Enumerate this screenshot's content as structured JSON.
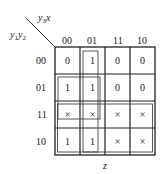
{
  "kmap": {
    "col_var_label": "y3x",
    "row_var_label": "y1y2",
    "bottom_label": "z",
    "col_headers": [
      "00",
      "01",
      "11",
      "10"
    ],
    "row_headers": [
      "00",
      "01",
      "11",
      "10"
    ],
    "rows": [
      [
        "0",
        "1",
        "0",
        "0"
      ],
      [
        "1",
        "1",
        "0",
        "0"
      ],
      [
        "×",
        "×",
        "×",
        "×"
      ],
      [
        "1",
        "1",
        "×",
        "×"
      ]
    ],
    "groups": [
      {
        "name": "column-01-group",
        "cells": "rows 00-10, col 01"
      },
      {
        "name": "rows-01-11-cols-00-01-group",
        "cells": "rows 01-11, cols 00-01"
      },
      {
        "name": "rows-11-10-all-cols-group",
        "cells": "rows 11-10, all cols"
      }
    ]
  }
}
